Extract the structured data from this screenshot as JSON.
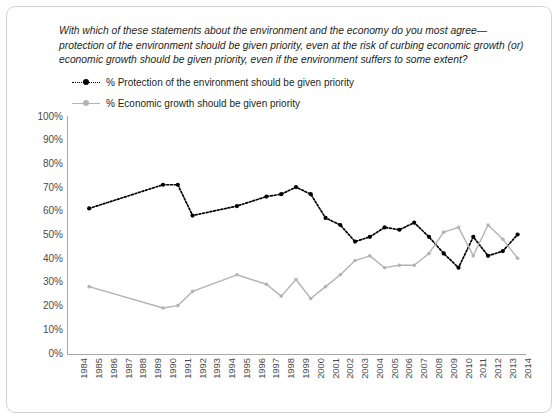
{
  "question": "With which of these statements about the environment and the economy do you most agree—protection of the environment should be given priority, even at the risk of curbing economic growth (or) economic growth should be given priority, even if the environment suffers to some extent?",
  "legend": {
    "position": "top-left",
    "items": [
      {
        "label": "% Protection of the environment should be given priority",
        "marker": "dotted-line-with-dot-marker",
        "color": "#000000"
      },
      {
        "label": "% Economic growth should be given priority",
        "marker": "solid-line-with-dot-marker",
        "color": "#b3b3b3"
      }
    ]
  },
  "colors": {
    "environment_series": "#000000",
    "economy_series": "#b3b3b3",
    "axis": "#a8a8a8",
    "border": "#d2d2d2",
    "text": "#231f20",
    "tick_text": "#4a4a4a",
    "background": "#ffffff"
  },
  "chart_data": {
    "type": "line",
    "title": "",
    "subtitle": "",
    "xlabel": "",
    "ylabel": "",
    "grid": false,
    "legend_position": "top-left",
    "ylim": [
      0,
      100
    ],
    "ytick_labels": [
      "100%",
      "90%",
      "80%",
      "70%",
      "60%",
      "50%",
      "40%",
      "30%",
      "20%",
      "10%",
      "0%"
    ],
    "ytick_values": [
      100,
      90,
      80,
      70,
      60,
      50,
      40,
      30,
      20,
      10,
      0
    ],
    "x": [
      1984,
      1985,
      1986,
      1987,
      1988,
      1989,
      1990,
      1991,
      1992,
      1993,
      1994,
      1995,
      1996,
      1997,
      1998,
      1999,
      2000,
      2001,
      2002,
      2003,
      2004,
      2005,
      2006,
      2007,
      2008,
      2009,
      2010,
      2011,
      2012,
      2013,
      2014
    ],
    "categories": [
      "1984",
      "1985",
      "1986",
      "1987",
      "1988",
      "1989",
      "1990",
      "1991",
      "1992",
      "1993",
      "1994",
      "1995",
      "1996",
      "1997",
      "1998",
      "1999",
      "2000",
      "2001",
      "2002",
      "2003",
      "2004",
      "2005",
      "2006",
      "2007",
      "2008",
      "2009",
      "2010",
      "2011",
      "2012",
      "2013",
      "2014"
    ],
    "series": [
      {
        "name": "% Protection of the environment should be given priority",
        "color": "#000000",
        "style": "dotted",
        "values": [
          null,
          61,
          null,
          null,
          null,
          null,
          71,
          71,
          58,
          null,
          null,
          62,
          null,
          66,
          67,
          70,
          67,
          57,
          54,
          47,
          49,
          53,
          52,
          55,
          49,
          42,
          36,
          49,
          41,
          43,
          50
        ]
      },
      {
        "name": "% Economic growth should be given priority",
        "color": "#b3b3b3",
        "style": "solid",
        "values": [
          null,
          28,
          null,
          null,
          null,
          null,
          19,
          20,
          26,
          null,
          null,
          33,
          null,
          29,
          24,
          31,
          23,
          28,
          33,
          39,
          41,
          36,
          37,
          37,
          42,
          51,
          53,
          41,
          54,
          48,
          40
        ]
      }
    ]
  }
}
